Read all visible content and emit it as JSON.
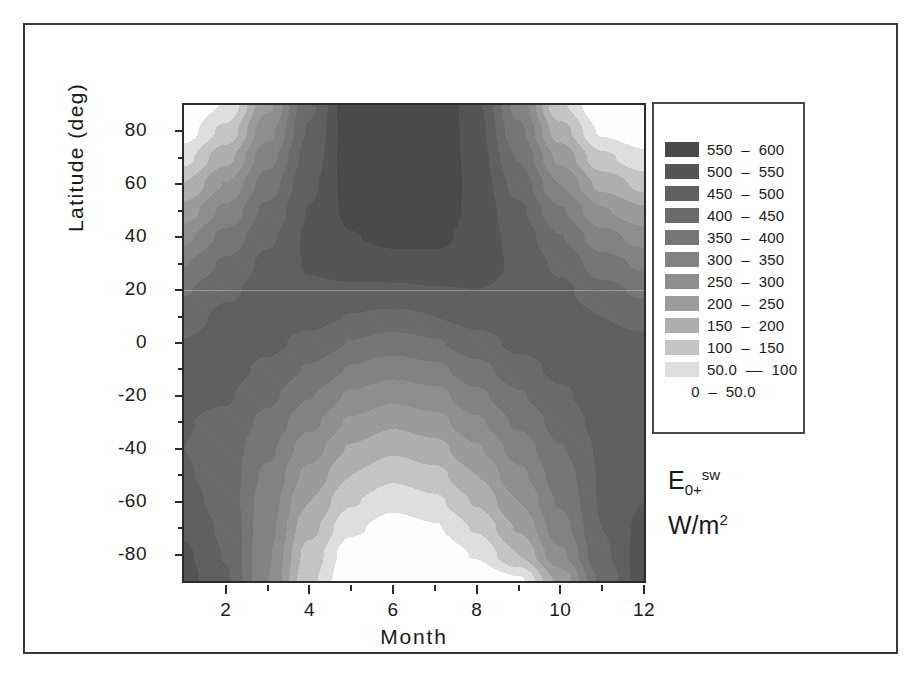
{
  "figure": {
    "annotation_main": "E",
    "annotation_sub": "0+",
    "annotation_sup": "sw",
    "annotation_units": "W/m",
    "annotation_units_sup": "2"
  },
  "legend": {
    "entries": [
      {
        "label": "550  –  600",
        "color": "#4a4a4a",
        "low": 550,
        "high": 600
      },
      {
        "label": "500  –  550",
        "color": "#555555",
        "low": 500,
        "high": 550
      },
      {
        "label": "450  –  500",
        "color": "#606060",
        "low": 450,
        "high": 500
      },
      {
        "label": "400  –  450",
        "color": "#6b6b6b",
        "low": 400,
        "high": 450
      },
      {
        "label": "350  –  400",
        "color": "#767676",
        "low": 350,
        "high": 400
      },
      {
        "label": "300  –  350",
        "color": "#828282",
        "low": 300,
        "high": 350
      },
      {
        "label": "250  –  300",
        "color": "#8e8e8e",
        "low": 250,
        "high": 300
      },
      {
        "label": "200  –  250",
        "color": "#9b9b9b",
        "low": 200,
        "high": 250
      },
      {
        "label": "150  –  200",
        "color": "#aeaeae",
        "low": 150,
        "high": 200
      },
      {
        "label": "100  –  150",
        "color": "#c4c4c4",
        "low": 100,
        "high": 150
      },
      {
        "label": "50.0  ––  100",
        "color": "#dedede",
        "low": 50,
        "high": 100
      },
      {
        "label": "0  –  50.0",
        "color": "#ffffff",
        "low": 0,
        "high": 50
      }
    ]
  },
  "chart_data": {
    "type": "heatmap",
    "title": "",
    "xlabel": "Month",
    "ylabel": "Latitude (deg)",
    "zlabel": "E0+sw (W/m2)",
    "xlim": [
      1,
      12
    ],
    "ylim": [
      -90,
      90
    ],
    "zlim": [
      0,
      600
    ],
    "grid": false,
    "legend_position": "right",
    "x_ticks_major": [
      2,
      4,
      6,
      8,
      10,
      12
    ],
    "x_ticks_minor": [
      1,
      3,
      5,
      7,
      9,
      11
    ],
    "y_ticks_major": [
      80,
      60,
      40,
      20,
      0,
      -20,
      -40,
      -60,
      -80
    ],
    "y_ticks_minor": [
      70,
      50,
      30,
      10,
      -10,
      -30,
      -50,
      -70
    ],
    "contour_levels": [
      0,
      50,
      100,
      150,
      200,
      250,
      300,
      350,
      400,
      450,
      500,
      550,
      600
    ],
    "x": [
      1,
      2,
      3,
      4,
      5,
      6,
      7,
      8,
      9,
      10,
      11,
      12
    ],
    "y": [
      -90,
      -80,
      -70,
      -60,
      -50,
      -40,
      -30,
      -20,
      -10,
      0,
      10,
      20,
      30,
      40,
      50,
      60,
      70,
      80,
      90
    ],
    "z_comment": "Rows are latitude from -90 to 90 (step 10); columns are month 1..12. Values are downwelling shortwave irradiance at the surface in W/m2.",
    "z": [
      [
        520,
        455,
        300,
        110,
        5,
        0,
        0,
        0,
        40,
        215,
        410,
        530
      ],
      [
        508,
        448,
        305,
        130,
        20,
        0,
        5,
        55,
        150,
        290,
        440,
        525
      ],
      [
        492,
        440,
        315,
        165,
        60,
        25,
        45,
        105,
        205,
        330,
        450,
        515
      ],
      [
        470,
        428,
        325,
        200,
        105,
        65,
        90,
        155,
        250,
        355,
        455,
        500
      ],
      [
        455,
        425,
        340,
        235,
        150,
        110,
        135,
        200,
        288,
        375,
        455,
        482
      ],
      [
        450,
        428,
        360,
        272,
        195,
        158,
        182,
        245,
        322,
        398,
        458,
        472
      ],
      [
        452,
        440,
        385,
        312,
        243,
        208,
        232,
        292,
        358,
        420,
        468,
        472
      ],
      [
        460,
        455,
        412,
        352,
        292,
        262,
        283,
        338,
        395,
        442,
        478,
        478
      ],
      [
        462,
        468,
        440,
        395,
        345,
        318,
        338,
        385,
        430,
        462,
        482,
        478
      ],
      [
        452,
        470,
        462,
        435,
        398,
        378,
        395,
        430,
        462,
        472,
        472,
        462
      ],
      [
        430,
        462,
        472,
        468,
        448,
        438,
        450,
        470,
        482,
        472,
        450,
        432
      ],
      [
        395,
        440,
        472,
        492,
        492,
        492,
        498,
        500,
        492,
        462,
        415,
        390
      ],
      [
        348,
        408,
        462,
        505,
        525,
        532,
        535,
        522,
        492,
        438,
        372,
        340
      ],
      [
        288,
        365,
        442,
        508,
        548,
        562,
        562,
        532,
        480,
        402,
        318,
        278
      ],
      [
        222,
        312,
        412,
        502,
        562,
        588,
        582,
        535,
        460,
        355,
        255,
        208
      ],
      [
        152,
        252,
        375,
        490,
        572,
        602,
        595,
        532,
        432,
        300,
        185,
        135
      ],
      [
        85,
        185,
        332,
        472,
        578,
        612,
        600,
        525,
        398,
        238,
        112,
        65
      ],
      [
        25,
        115,
        285,
        455,
        582,
        622,
        605,
        518,
        362,
        172,
        42,
        10
      ],
      [
        0,
        55,
        240,
        440,
        588,
        632,
        612,
        512,
        330,
        108,
        0,
        0
      ]
    ]
  }
}
